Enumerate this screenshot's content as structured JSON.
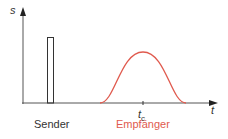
{
  "diagram": {
    "y_axis_label": "s",
    "x_axis_label": "t",
    "tick_label": "t",
    "tick_subscript": "c",
    "sender_label": "Sender",
    "receiver_label": "Empfänger",
    "colors": {
      "axis": "#333333",
      "sender_pulse": "#333333",
      "receiver_pulse": "#e05a4e",
      "receiver_label": "#e05a4e"
    }
  }
}
